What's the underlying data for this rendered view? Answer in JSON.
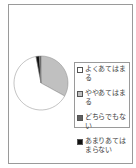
{
  "chart_data": {
    "type": "pie",
    "title": "",
    "categories": [
      "よくあてはまる",
      "ややあてはまる",
      "どちらでもない",
      "あまりあてはまらない"
    ],
    "values": [
      64,
      33,
      1,
      2
    ],
    "colors": [
      "#ffffff",
      "#c0c0c0",
      "#606060",
      "#111111"
    ],
    "legend_position": "right"
  },
  "legend": {
    "items": [
      {
        "label": "よくあてはまる",
        "color": "#ffffff"
      },
      {
        "label": "ややあてはまる",
        "color": "#c0c0c0"
      },
      {
        "label": "どちらでもない",
        "color": "#606060"
      },
      {
        "label": "あまりあてはまらない",
        "color": "#111111"
      }
    ]
  }
}
